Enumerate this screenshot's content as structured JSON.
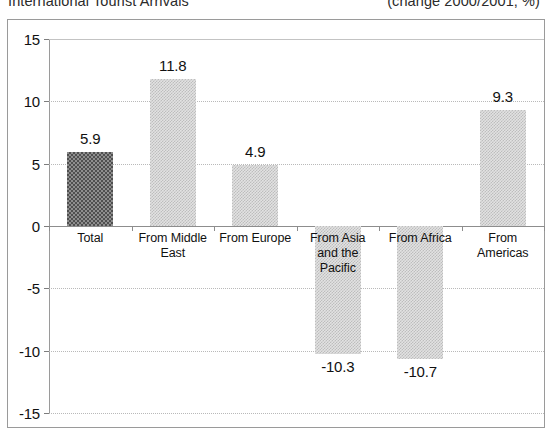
{
  "chart_data": {
    "type": "bar",
    "title": "International Tourist Arrivals",
    "subtitle": "(change 2000/2001, %)",
    "xlabel": "",
    "ylabel": "",
    "ylim": [
      -15,
      15
    ],
    "yticks": [
      15,
      10,
      5,
      0,
      -5,
      -10,
      -15
    ],
    "ytick_labels": [
      "15",
      "10",
      "5",
      "0",
      "-5",
      "-10",
      "-15"
    ],
    "grid": true,
    "legend": "none",
    "categories": [
      "Total",
      "From Middle East",
      "From Europe",
      "From Asia and the Pacific",
      "From Africa",
      "From Americas"
    ],
    "category_label_lines": [
      [
        "Total"
      ],
      [
        "From Middle",
        "East"
      ],
      [
        "From Europe"
      ],
      [
        "From Asia",
        "and the",
        "Pacific"
      ],
      [
        "From Africa"
      ],
      [
        "From",
        "Americas"
      ]
    ],
    "values": [
      5.9,
      11.8,
      4.9,
      -10.3,
      -10.7,
      9.3
    ],
    "value_labels": [
      "5.9",
      "11.8",
      "4.9",
      "-10.3",
      "-10.7",
      "9.3"
    ],
    "bar_styles": [
      "dark",
      "light",
      "light",
      "light",
      "light",
      "light"
    ],
    "colors": {
      "bar_dark": "#808080",
      "bar_light": "#d8d8d8",
      "gridline": "#b9b9b9",
      "axis": "#8d8d8d",
      "frame": "#9a9a9a",
      "text": "#111111",
      "background": "#ffffff"
    }
  }
}
